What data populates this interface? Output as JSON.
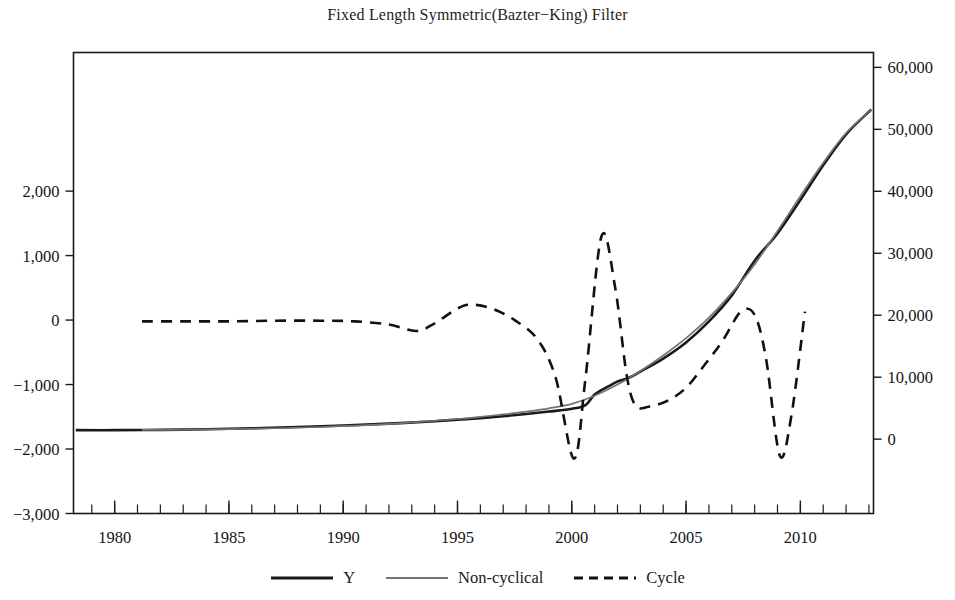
{
  "chart_data": {
    "type": "line",
    "title": "Fixed Length Symmetric(Bazter−King) Filter",
    "xlabel": "",
    "ylabel": "",
    "grid": false,
    "legend_position": "bottom",
    "xlim": [
      1978.2,
      2013.2
    ],
    "x_ticks": [
      1980,
      1985,
      1990,
      1995,
      2000,
      2005,
      2010
    ],
    "x_tick_labels": [
      "1980",
      "1985",
      "1990",
      "1995",
      "2000",
      "2005",
      "2010"
    ],
    "x_minor_tick_step": 1,
    "left_axis": {
      "ylim": [
        -3000,
        4150
      ],
      "ticks": [
        2000,
        1000,
        0,
        -1000,
        -2000,
        -3000
      ],
      "tick_labels": [
        "2,000",
        "1,000",
        "0",
        "−1,000",
        "−2,000",
        "−3,000"
      ],
      "series": [
        "Cycle"
      ]
    },
    "right_axis": {
      "ylim": [
        -12000,
        62400
      ],
      "ticks": [
        60000,
        50000,
        40000,
        30000,
        20000,
        10000,
        0
      ],
      "tick_labels": [
        "60,000",
        "50,000",
        "40,000",
        "30,000",
        "20,000",
        "10,000",
        "0"
      ],
      "series": [
        "Y",
        "Non-cyclical"
      ]
    },
    "series": [
      {
        "name": "Y",
        "style": "solid",
        "color": "#1a1a1a",
        "width": 2.6,
        "axis": "right",
        "x": [
          1978.3,
          1980,
          1982,
          1984,
          1986,
          1988,
          1990,
          1992,
          1994,
          1995,
          1996,
          1997,
          1998,
          1999,
          2000,
          2000.6,
          2001,
          2001.6,
          2002,
          2002.5,
          2003,
          2004,
          2005,
          2006,
          2007,
          2008,
          2009,
          2010,
          2011,
          2012,
          2013.1
        ],
        "y": [
          1450,
          1450,
          1500,
          1600,
          1750,
          1950,
          2200,
          2500,
          2900,
          3150,
          3400,
          3700,
          4050,
          4450,
          4900,
          5500,
          7200,
          8500,
          9300,
          9900,
          10900,
          13000,
          15600,
          19000,
          23200,
          28800,
          33200,
          38600,
          44200,
          49200,
          53200
        ]
      },
      {
        "name": "Non-cyclical",
        "style": "solid",
        "color": "#737373",
        "width": 1.7,
        "axis": "right",
        "x": [
          1981.2,
          1983,
          1985,
          1987,
          1989,
          1991,
          1993,
          1995,
          1996,
          1997,
          1998,
          1999,
          2000,
          2001,
          2002,
          2003,
          2004,
          2005,
          2006,
          2007,
          2008,
          2009,
          2010,
          2011,
          2012,
          2013.1
        ],
        "y": [
          1480,
          1530,
          1620,
          1760,
          1960,
          2250,
          2700,
          3250,
          3600,
          4000,
          4450,
          4980,
          5700,
          7000,
          8800,
          11000,
          13500,
          16300,
          19600,
          23600,
          28200,
          33600,
          39200,
          44600,
          49400,
          53200
        ]
      },
      {
        "name": "Cycle",
        "style": "dashed",
        "color": "#111111",
        "width": 2.6,
        "axis": "left",
        "x": [
          1981.2,
          1983,
          1985,
          1987,
          1989,
          1990.5,
          1992,
          1993.2,
          1994,
          1995,
          1995.6,
          1996.5,
          1997.5,
          1998.5,
          1999.3,
          2000.1,
          2000.6,
          2001.3,
          2001.9,
          2002.4,
          2002.8,
          2003.4,
          2004.2,
          2005,
          2005.8,
          2006.6,
          2007.4,
          2008,
          2008.5,
          2009.1,
          2009.6,
          2010.2
        ],
        "y": [
          -20,
          -20,
          -20,
          -10,
          -10,
          -20,
          -70,
          -170,
          -50,
          180,
          240,
          180,
          0,
          -300,
          -900,
          -2150,
          -900,
          1300,
          500,
          -850,
          -1330,
          -1340,
          -1250,
          -1050,
          -700,
          -320,
          130,
          80,
          -600,
          -2100,
          -1500,
          130
        ]
      }
    ]
  },
  "legend": {
    "items": [
      {
        "label": "Y",
        "style": "solid-thick",
        "color": "#1a1a1a"
      },
      {
        "label": "Non-cyclical",
        "style": "solid-thin",
        "color": "#737373"
      },
      {
        "label": "Cycle",
        "style": "dashed",
        "color": "#111111"
      }
    ]
  }
}
